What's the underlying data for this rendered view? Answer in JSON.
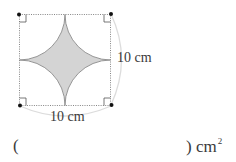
{
  "figure": {
    "shape": "square with four quarter-circle arcs cut from corners forming a concave star",
    "fill_color": "#d4d4d4",
    "stroke_color": "#888888",
    "dimension_arc_color": "#dddddd",
    "side_right": "10 cm",
    "side_bottom": "10 cm"
  },
  "answer": {
    "open_paren": "(",
    "close_paren": ")",
    "unit": "cm",
    "unit_exponent": "2",
    "value": ""
  }
}
